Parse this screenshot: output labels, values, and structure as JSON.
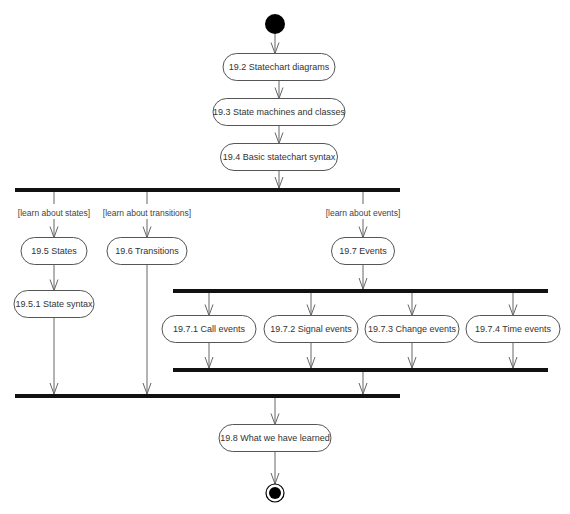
{
  "diagram": {
    "type": "UML activity diagram",
    "colors": {
      "line": "#666666",
      "bar": "#111111",
      "node_fill": "#ffffff",
      "node_stroke": "#555555",
      "text": "#333333"
    },
    "nodes": [
      {
        "id": "n19_2",
        "label": "19.2 Statechart diagrams",
        "cx": 279,
        "cy": 67,
        "w": 112,
        "h": 27
      },
      {
        "id": "n19_3",
        "label": "19.3 State machines and classes",
        "cx": 279,
        "cy": 112,
        "w": 132,
        "h": 27
      },
      {
        "id": "n19_4",
        "label": "19.4 Basic statechart syntax",
        "cx": 279,
        "cy": 157,
        "w": 117,
        "h": 27
      },
      {
        "id": "n19_5",
        "label": "19.5 States",
        "cx": 54,
        "cy": 251,
        "w": 66,
        "h": 27
      },
      {
        "id": "n19_5_1",
        "label": "19.5.1 State syntax",
        "cx": 54,
        "cy": 304,
        "w": 80,
        "h": 27
      },
      {
        "id": "n19_6",
        "label": "19.6 Transitions",
        "cx": 147,
        "cy": 251,
        "w": 80,
        "h": 27
      },
      {
        "id": "n19_7",
        "label": "19.7 Events",
        "cx": 363,
        "cy": 251,
        "w": 63,
        "h": 27
      },
      {
        "id": "n19_7_1",
        "label": "19.7.1 Call events",
        "cx": 209,
        "cy": 329,
        "w": 94,
        "h": 27
      },
      {
        "id": "n19_7_2",
        "label": "19.7.2 Signal events",
        "cx": 311,
        "cy": 329,
        "w": 94,
        "h": 27
      },
      {
        "id": "n19_7_3",
        "label": "19.7.3 Change events",
        "cx": 412,
        "cy": 329,
        "w": 94,
        "h": 27
      },
      {
        "id": "n19_7_4",
        "label": "19.7.4 Time events",
        "cx": 513,
        "cy": 329,
        "w": 94,
        "h": 27
      },
      {
        "id": "n19_8",
        "label": "19.8 What we have learned",
        "cx": 275,
        "cy": 438,
        "w": 112,
        "h": 27
      }
    ],
    "guards": [
      {
        "label": "[learn about states]",
        "x": 54,
        "y": 213
      },
      {
        "label": "[learn about transitions]",
        "x": 147,
        "y": 213
      },
      {
        "label": "[learn about events]",
        "x": 363,
        "y": 213
      }
    ],
    "bars": [
      {
        "id": "fork-main",
        "x1": 15,
        "x2": 400,
        "y": 190
      },
      {
        "id": "fork-events",
        "x1": 173,
        "x2": 548,
        "y": 291
      },
      {
        "id": "join-events",
        "x1": 173,
        "x2": 548,
        "y": 370
      },
      {
        "id": "join-main",
        "x1": 15,
        "x2": 400,
        "y": 396
      }
    ],
    "start": {
      "cx": 275,
      "cy": 24,
      "r": 10
    },
    "end": {
      "cx": 275,
      "cy": 493,
      "r": 8
    },
    "edges": [
      {
        "x1": 275,
        "y1": 34,
        "x2": 275,
        "y2": 53.5,
        "arrow": true
      },
      {
        "x1": 279,
        "y1": 80.5,
        "x2": 279,
        "y2": 98.5,
        "arrow": true
      },
      {
        "x1": 279,
        "y1": 125.5,
        "x2": 279,
        "y2": 143.5,
        "arrow": true
      },
      {
        "x1": 279,
        "y1": 170.5,
        "x2": 279,
        "y2": 188,
        "arrow": true
      },
      {
        "x1": 54,
        "y1": 192,
        "x2": 54,
        "y2": 204,
        "arrow": false
      },
      {
        "x1": 54,
        "y1": 219,
        "x2": 54,
        "y2": 237.5,
        "arrow": true
      },
      {
        "x1": 147,
        "y1": 192,
        "x2": 147,
        "y2": 204,
        "arrow": false
      },
      {
        "x1": 147,
        "y1": 219,
        "x2": 147,
        "y2": 237.5,
        "arrow": true
      },
      {
        "x1": 363,
        "y1": 192,
        "x2": 363,
        "y2": 204,
        "arrow": false
      },
      {
        "x1": 363,
        "y1": 219,
        "x2": 363,
        "y2": 237.5,
        "arrow": true
      },
      {
        "x1": 54,
        "y1": 264.5,
        "x2": 54,
        "y2": 290.5,
        "arrow": true
      },
      {
        "x1": 54,
        "y1": 317.5,
        "x2": 54,
        "y2": 394,
        "arrow": true
      },
      {
        "x1": 147,
        "y1": 264.5,
        "x2": 147,
        "y2": 394,
        "arrow": true
      },
      {
        "x1": 363,
        "y1": 264.5,
        "x2": 363,
        "y2": 289,
        "arrow": true
      },
      {
        "x1": 209,
        "y1": 293,
        "x2": 209,
        "y2": 315.5,
        "arrow": true
      },
      {
        "x1": 311,
        "y1": 293,
        "x2": 311,
        "y2": 315.5,
        "arrow": true
      },
      {
        "x1": 412,
        "y1": 293,
        "x2": 412,
        "y2": 315.5,
        "arrow": true
      },
      {
        "x1": 513,
        "y1": 293,
        "x2": 513,
        "y2": 315.5,
        "arrow": true
      },
      {
        "x1": 209,
        "y1": 342.5,
        "x2": 209,
        "y2": 368,
        "arrow": true
      },
      {
        "x1": 311,
        "y1": 342.5,
        "x2": 311,
        "y2": 368,
        "arrow": true
      },
      {
        "x1": 412,
        "y1": 342.5,
        "x2": 412,
        "y2": 368,
        "arrow": true
      },
      {
        "x1": 513,
        "y1": 342.5,
        "x2": 513,
        "y2": 368,
        "arrow": true
      },
      {
        "x1": 363,
        "y1": 372,
        "x2": 363,
        "y2": 394,
        "arrow": true
      },
      {
        "x1": 275,
        "y1": 398,
        "x2": 275,
        "y2": 424.5,
        "arrow": true
      },
      {
        "x1": 275,
        "y1": 451.5,
        "x2": 275,
        "y2": 484,
        "arrow": true
      }
    ]
  }
}
